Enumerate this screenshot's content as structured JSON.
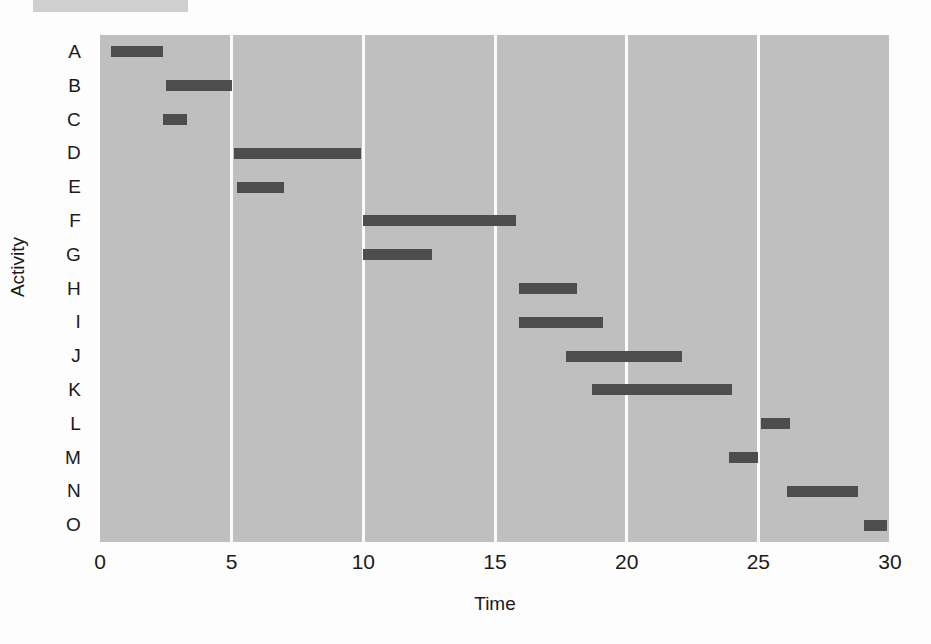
{
  "chart_data": {
    "type": "bar",
    "subtype": "gantt",
    "title": "",
    "xlabel": "Time",
    "ylabel": "Activity",
    "xlim": [
      0,
      30
    ],
    "xticks": [
      0,
      5,
      10,
      15,
      20,
      25,
      30
    ],
    "xtick_labels": [
      "0",
      "5",
      "10",
      "15",
      "20",
      "25",
      "30"
    ],
    "categories": [
      "A",
      "B",
      "C",
      "D",
      "E",
      "F",
      "G",
      "H",
      "I",
      "J",
      "K",
      "L",
      "M",
      "N",
      "O"
    ],
    "grid": "vertical gridlines at each x tick",
    "legend": "none",
    "tasks": [
      {
        "activity": "A",
        "start": 0.4,
        "end": 2.4,
        "duration": 2.0
      },
      {
        "activity": "B",
        "start": 2.5,
        "end": 5.0,
        "duration": 2.5
      },
      {
        "activity": "C",
        "start": 2.4,
        "end": 3.3,
        "duration": 0.9
      },
      {
        "activity": "D",
        "start": 5.1,
        "end": 9.9,
        "duration": 4.8
      },
      {
        "activity": "E",
        "start": 5.2,
        "end": 7.0,
        "duration": 1.8
      },
      {
        "activity": "F",
        "start": 10.0,
        "end": 15.8,
        "duration": 5.8
      },
      {
        "activity": "G",
        "start": 10.0,
        "end": 12.6,
        "duration": 2.6
      },
      {
        "activity": "H",
        "start": 15.9,
        "end": 18.1,
        "duration": 2.2
      },
      {
        "activity": "I",
        "start": 15.9,
        "end": 19.1,
        "duration": 3.2
      },
      {
        "activity": "J",
        "start": 17.7,
        "end": 22.1,
        "duration": 4.4
      },
      {
        "activity": "K",
        "start": 18.7,
        "end": 24.0,
        "duration": 5.3
      },
      {
        "activity": "L",
        "start": 25.1,
        "end": 26.2,
        "duration": 1.1
      },
      {
        "activity": "M",
        "start": 23.9,
        "end": 25.0,
        "duration": 1.1
      },
      {
        "activity": "N",
        "start": 26.1,
        "end": 28.8,
        "duration": 2.7
      },
      {
        "activity": "O",
        "start": 29.0,
        "end": 29.9,
        "duration": 0.9
      }
    ]
  },
  "colors": {
    "plot_background": "#bfbfbf",
    "bar": "#4d4d4d",
    "gridline": "#fbfbfb",
    "page_background": "#fdfdfd",
    "header_swatch": "#cfcfcf",
    "text": "#1a1a1a"
  }
}
